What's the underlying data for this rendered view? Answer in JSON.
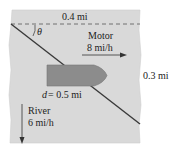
{
  "diagram": {
    "type": "river-crossing",
    "labels": {
      "width": "0.4 mi",
      "angle": "θ",
      "motor_title": "Motor",
      "motor_speed": "8 mi/h",
      "distance_var": "d",
      "distance_eq": " = 0.5 mi",
      "river_title": "River",
      "river_speed": "6 mi/h",
      "downstream": "0.3 mi"
    },
    "colors": {
      "river": "#d9d9d9",
      "boat": "#8c8c8c",
      "lines": "#3a3a3a",
      "text": "#222222"
    }
  }
}
